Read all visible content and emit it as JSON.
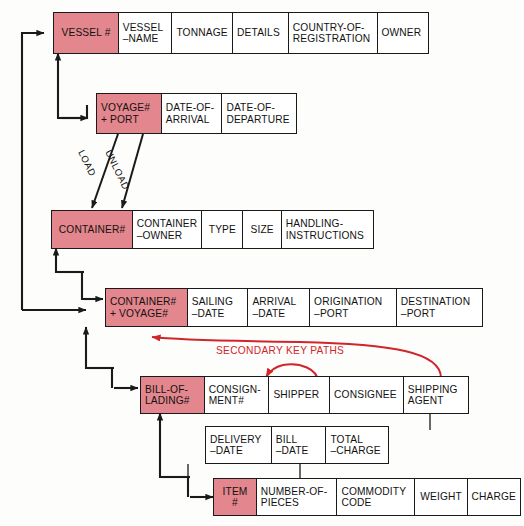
{
  "diagram": {
    "colors": {
      "key_fill": "#e3868d",
      "field_fill": "#ffffff",
      "line": "#1a1a1a",
      "secondary_path": "#d0262b",
      "background": "#fdfdfb"
    },
    "annotations": {
      "load": "LOAD",
      "unload": "UNLOAD",
      "secondary_key_paths": "SECONDARY KEY PATHS"
    },
    "records": [
      {
        "name": "vessel",
        "fields": [
          {
            "label": "VESSEL #",
            "key": true,
            "width": 66
          },
          {
            "label": "VESSEL\n–NAME",
            "key": false,
            "width": 55
          },
          {
            "label": "TONNAGE",
            "key": false,
            "width": 62
          },
          {
            "label": "DETAILS",
            "key": false,
            "width": 57
          },
          {
            "label": "COUNTRY-OF-\nREGISTRATION",
            "key": false,
            "width": 90
          },
          {
            "label": "OWNER",
            "key": false,
            "width": 52
          }
        ]
      },
      {
        "name": "voyage-port",
        "fields": [
          {
            "label": "VOYAGE#\n+ PORT",
            "key": true,
            "width": 66
          },
          {
            "label": "DATE-OF-\nARRIVAL",
            "key": false,
            "width": 62
          },
          {
            "label": "DATE-OF-\nDEPARTURE",
            "key": false,
            "width": 76
          }
        ]
      },
      {
        "name": "container",
        "fields": [
          {
            "label": "CONTAINER#",
            "key": true,
            "width": 82
          },
          {
            "label": "CONTAINER\n–OWNER",
            "key": false,
            "width": 71
          },
          {
            "label": "TYPE",
            "key": false,
            "width": 42
          },
          {
            "label": "SIZE",
            "key": false,
            "width": 40
          },
          {
            "label": "HANDLING-\nINSTRUCTIONS",
            "key": false,
            "width": 93
          }
        ]
      },
      {
        "name": "container-voyage",
        "fields": [
          {
            "label": "CONTAINER#\n+ VOYAGE#",
            "key": true,
            "width": 83
          },
          {
            "label": "SAILING\n–DATE",
            "key": false,
            "width": 62
          },
          {
            "label": "ARRIVAL\n–DATE",
            "key": false,
            "width": 63
          },
          {
            "label": "ORIGINATION\n–PORT",
            "key": false,
            "width": 88
          },
          {
            "label": "DESTINATION\n–PORT",
            "key": false,
            "width": 87
          }
        ]
      },
      {
        "name": "bill-of-lading",
        "fields": [
          {
            "label": "BILL-OF-\nLADING#",
            "key": true,
            "width": 65
          },
          {
            "label": "CONSIGN-\nMENT#",
            "key": false,
            "width": 66
          },
          {
            "label": "SHIPPER",
            "key": false,
            "width": 62
          },
          {
            "label": "CONSIGNEE",
            "key": false,
            "width": 75
          },
          {
            "label": "SHIPPING\nAGENT",
            "key": false,
            "width": 66
          }
        ]
      },
      {
        "name": "bill-of-lading-continued",
        "fields": [
          {
            "label": "DELIVERY\n–DATE",
            "key": false,
            "width": 67
          },
          {
            "label": "BILL\n–DATE",
            "key": false,
            "width": 56
          },
          {
            "label": "TOTAL\n–CHARGE",
            "key": false,
            "width": 64
          }
        ]
      },
      {
        "name": "item",
        "fields": [
          {
            "label": "ITEM\n#",
            "key": true,
            "width": 44
          },
          {
            "label": "NUMBER-OF-\nPIECES",
            "key": false,
            "width": 82
          },
          {
            "label": "COMMODITY\nCODE",
            "key": false,
            "width": 79
          },
          {
            "label": "WEIGHT",
            "key": false,
            "width": 54
          },
          {
            "label": "CHARGE",
            "key": false,
            "width": 54
          }
        ]
      }
    ]
  }
}
